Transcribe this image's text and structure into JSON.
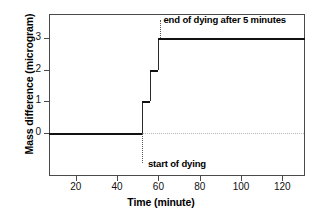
{
  "chart_data": {
    "type": "line",
    "title": "",
    "subtitle": "",
    "xlabel": "Time (minute)",
    "ylabel": "Mass difference (microgram)",
    "xlim": [
      7,
      131
    ],
    "ylim": [
      -1.35,
      3.75
    ],
    "xticks": [
      20,
      40,
      60,
      80,
      100,
      120
    ],
    "xtick_labels": [
      "20",
      "40",
      "60",
      "80",
      "100",
      "120"
    ],
    "yticks": [
      0,
      1,
      2,
      3
    ],
    "ytick_labels": [
      "0",
      "1",
      "2",
      "3"
    ],
    "grid": false,
    "legend": null,
    "series": [
      {
        "name": "Mass difference",
        "style": "step",
        "color": "#121212",
        "x": [
          7,
          52,
          52,
          56,
          56,
          60,
          60,
          131
        ],
        "y": [
          0,
          0,
          1,
          1,
          2,
          2,
          3,
          3
        ]
      }
    ],
    "steps": [
      {
        "level": 0,
        "x_start": 7,
        "x_end": 52
      },
      {
        "level": 1,
        "x_start": 52,
        "x_end": 56
      },
      {
        "level": 2,
        "x_start": 56,
        "x_end": 60
      },
      {
        "level": 3,
        "x_start": 60,
        "x_end": 131
      }
    ],
    "reference_lines": [
      {
        "axis": "y",
        "value": 0,
        "style": "dotted",
        "color": "#b8b8b8"
      }
    ],
    "annotations": [
      {
        "text": "end of dying after 5 minutes",
        "x": 61,
        "y": 3.55,
        "leader_to_y": 3.0,
        "position": "above-right"
      },
      {
        "text": "start of dying",
        "x": 52,
        "y": -0.95,
        "leader_to_y": 0.0,
        "position": "below"
      }
    ]
  },
  "axis": {
    "x_title": "Time (minute)",
    "y_title": "Mass difference (microgram)"
  },
  "annotations": {
    "end_of_dying": "end of dying after 5 minutes",
    "start_of_dying": "start of dying"
  },
  "colors": {
    "data_line": "#121212",
    "frame": "#4a4a4a",
    "guide": "#b8b8b8",
    "background": "#ffffff"
  }
}
